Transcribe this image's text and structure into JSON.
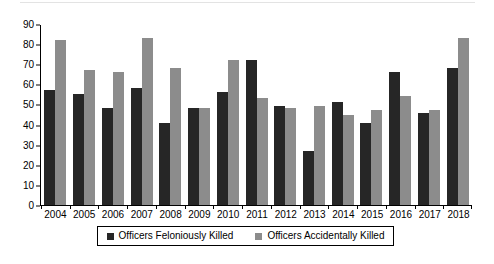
{
  "chart_data": {
    "type": "bar",
    "title": "",
    "subtitle": "",
    "xlabel": "",
    "ylabel": "",
    "ylim": [
      0,
      90
    ],
    "ytick_step": 10,
    "yticks": [
      0,
      10,
      20,
      30,
      40,
      50,
      60,
      70,
      80,
      90
    ],
    "grid": false,
    "legend_position": "bottom",
    "categories": [
      "2004",
      "2005",
      "2006",
      "2007",
      "2008",
      "2009",
      "2010",
      "2011",
      "2012",
      "2013",
      "2014",
      "2015",
      "2016",
      "2017",
      "2018"
    ],
    "series": [
      {
        "name": "Officers Feloniously Killed",
        "color": "#262626",
        "values": [
          57,
          55,
          48,
          58,
          41,
          48,
          56,
          72,
          49,
          27,
          51,
          41,
          66,
          46,
          68
        ]
      },
      {
        "name": "Officers Accidentally Killed",
        "color": "#8c8c8c",
        "values": [
          82,
          67,
          66,
          83,
          68,
          48,
          72,
          53,
          48,
          49,
          45,
          47,
          54,
          47,
          83
        ]
      }
    ]
  },
  "legend": {
    "entries": [
      {
        "label": "Officers Feloniously Killed"
      },
      {
        "label": "Officers Accidentally Killed"
      }
    ]
  },
  "colors": {
    "series_feloniously": "#262626",
    "series_accidentally": "#8c8c8c",
    "axis": "#000000",
    "background": "#ffffff"
  }
}
